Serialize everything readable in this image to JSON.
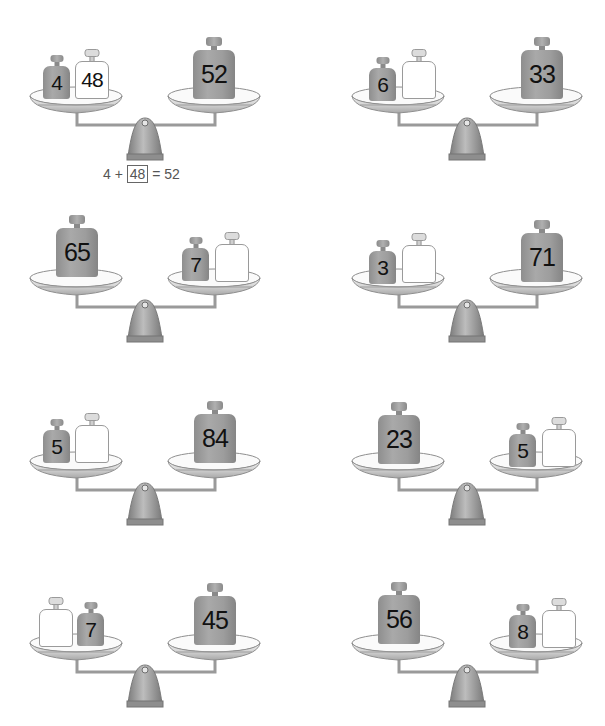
{
  "worksheet": {
    "problems": [
      {
        "id": 1,
        "left_pan": [
          {
            "value": "4",
            "type": "gray-small"
          },
          {
            "value": "48",
            "type": "white-answer"
          }
        ],
        "right_pan": [
          {
            "value": "52",
            "type": "gray-large"
          }
        ],
        "equation": {
          "a": "4",
          "plus": "+",
          "answer": "48",
          "equals": "=",
          "total": "52"
        }
      },
      {
        "id": 2,
        "left_pan": [
          {
            "value": "6",
            "type": "gray-small"
          },
          {
            "value": "",
            "type": "white-answer"
          }
        ],
        "right_pan": [
          {
            "value": "33",
            "type": "gray-large"
          }
        ]
      },
      {
        "id": 3,
        "left_pan": [
          {
            "value": "65",
            "type": "gray-large"
          }
        ],
        "right_pan": [
          {
            "value": "7",
            "type": "gray-small"
          },
          {
            "value": "",
            "type": "white-answer"
          }
        ]
      },
      {
        "id": 4,
        "left_pan": [
          {
            "value": "3",
            "type": "gray-small"
          },
          {
            "value": "",
            "type": "white-answer"
          }
        ],
        "right_pan": [
          {
            "value": "71",
            "type": "gray-large"
          }
        ]
      },
      {
        "id": 5,
        "left_pan": [
          {
            "value": "5",
            "type": "gray-small"
          },
          {
            "value": "",
            "type": "white-answer"
          }
        ],
        "right_pan": [
          {
            "value": "84",
            "type": "gray-large"
          }
        ]
      },
      {
        "id": 6,
        "left_pan": [
          {
            "value": "23",
            "type": "gray-large"
          }
        ],
        "right_pan": [
          {
            "value": "5",
            "type": "gray-small"
          },
          {
            "value": "",
            "type": "white-answer"
          }
        ]
      },
      {
        "id": 7,
        "left_pan": [
          {
            "value": "",
            "type": "white-answer"
          },
          {
            "value": "7",
            "type": "gray-small"
          }
        ],
        "right_pan": [
          {
            "value": "45",
            "type": "gray-large"
          }
        ]
      },
      {
        "id": 8,
        "left_pan": [
          {
            "value": "56",
            "type": "gray-large"
          }
        ],
        "right_pan": [
          {
            "value": "8",
            "type": "gray-small"
          },
          {
            "value": "",
            "type": "white-answer"
          }
        ]
      }
    ]
  },
  "colors": {
    "weight_gray": "#9d9d9d",
    "weight_white": "#ffffff",
    "scale_metal": "#c8c8c8",
    "outline": "#8a8a8a",
    "text": "#111111",
    "equation_text": "#555555"
  }
}
